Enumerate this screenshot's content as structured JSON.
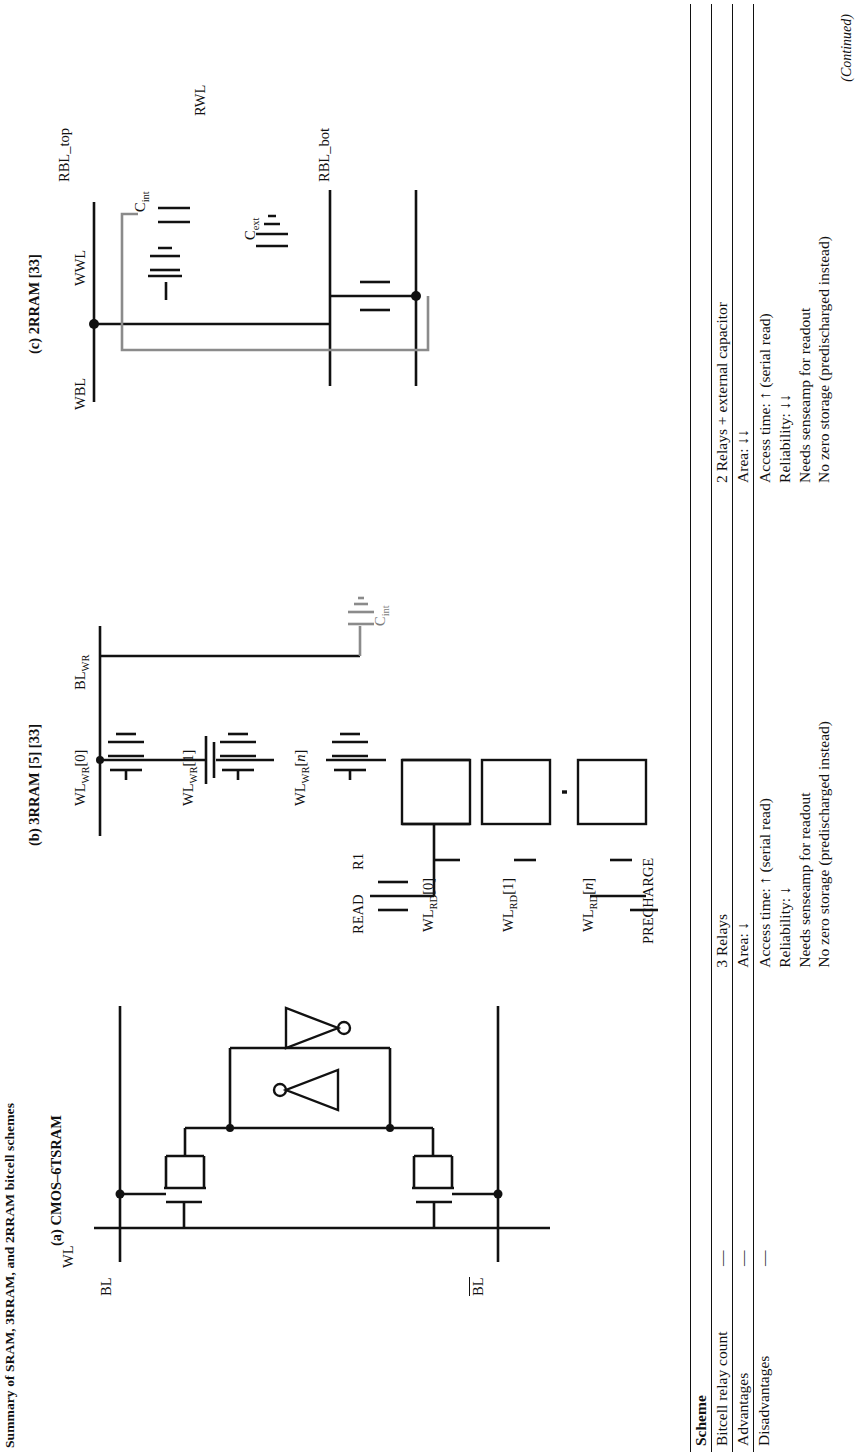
{
  "figure": {
    "caption_top": "Summary of SRAM, 3RRAM, and 2RRAM bitcell schemes",
    "panels": [
      {
        "id": "a",
        "header": "(a) CMOS–6TSRAM",
        "node_labels": [
          "BL",
          "BL̅",
          "WL"
        ]
      },
      {
        "id": "b",
        "header": "(b) 3RRAM [5] [33]",
        "node_labels": [
          "BL_WR",
          "WL_WR[0]",
          "WL_WR[1]",
          "WL_WR[n]",
          "WL_RD[0]",
          "WL_RD[1]",
          "WL_RD[n]",
          "READ",
          "R1",
          "PRECHARGE",
          "C_int"
        ]
      },
      {
        "id": "c",
        "header": "(c) 2RRAM [33]",
        "node_labels": [
          "WBL",
          "WWL",
          "RWL",
          "RBL_top",
          "RBL_bot",
          "C_int",
          "C_ext"
        ]
      }
    ]
  },
  "table": {
    "column_headers": [
      "Scheme",
      "(a) CMOS–6TSRAM",
      "(b) 3RRAM [5] [33]",
      "(c) 2RRAM [33]"
    ],
    "rows": [
      {
        "label": "Bitcell relay count",
        "cells": [
          {
            "lines": [
              "—"
            ]
          },
          {
            "lines": [
              "3 Relays"
            ]
          },
          {
            "lines": [
              "2 Relays + external capacitor"
            ]
          }
        ]
      },
      {
        "label": "Advantages",
        "cells": [
          {
            "lines": [
              "—"
            ]
          },
          {
            "lines": [
              "Area: ↓"
            ]
          },
          {
            "lines": [
              "Area: ↓↓"
            ]
          }
        ]
      },
      {
        "label": "Disadvantages",
        "cells": [
          {
            "lines": [
              "—"
            ]
          },
          {
            "lines": [
              "Access time: ↑ (serial read)",
              "Reliability: ↓",
              "Needs senseamp for readout",
              "No zero storage (predischarged instead)"
            ]
          },
          {
            "lines": [
              "Access time: ↑ (serial read)",
              "Reliability: ↓↓",
              "Needs senseamp for readout",
              "No zero storage (predischarged instead)"
            ]
          }
        ]
      }
    ],
    "footer_note": "(Continued)"
  },
  "colors": {
    "ink": "#111111",
    "grey_wire": "#8b8b8b",
    "paper": "#ffffff"
  }
}
